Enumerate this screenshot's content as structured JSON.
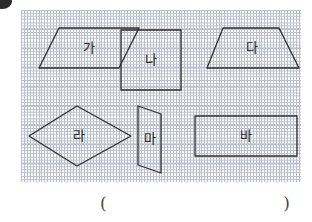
{
  "worksheet": {
    "bullet": "bullet-marker",
    "grid": {
      "columns": 14,
      "rows": 9,
      "cell_size": 20,
      "line_color": "#b9bfcc",
      "background": "#ffffff"
    },
    "shapes": [
      {
        "id": "shape-ga",
        "label": "가",
        "type": "parallelogram",
        "points": "38,18 118,18 98,58 18,58",
        "label_x": 68,
        "label_y": 38,
        "stroke": "#2e2e2e"
      },
      {
        "id": "shape-na",
        "label": "나",
        "type": "square",
        "points": "100,20 160,20 160,80 100,80",
        "label_x": 130,
        "label_y": 50,
        "stroke": "#2e2e2e"
      },
      {
        "id": "shape-da",
        "label": "다",
        "type": "trapezoid",
        "points": "202,18 258,18 278,58 186,58",
        "label_x": 231,
        "label_y": 38,
        "stroke": "#2e2e2e"
      },
      {
        "id": "shape-ra",
        "label": "라",
        "type": "rhombus",
        "points": "56,96 110,126 56,156 8,126",
        "label_x": 58,
        "label_y": 126,
        "stroke": "#2e2e2e"
      },
      {
        "id": "shape-ma",
        "label": "마",
        "type": "parallelogram",
        "points": "117,96 140,104 140,163 117,155",
        "label_x": 129,
        "label_y": 129,
        "stroke": "#2e2e2e"
      },
      {
        "id": "shape-ba",
        "label": "바",
        "type": "rectangle",
        "points": "174,106 276,106 276,146 174,146",
        "label_x": 225,
        "label_y": 126,
        "stroke": "#2e2e2e"
      }
    ],
    "answer": {
      "open_paren": "(",
      "close_paren": ")"
    }
  }
}
